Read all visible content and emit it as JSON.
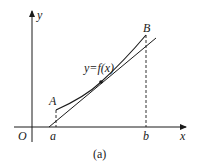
{
  "diagram": {
    "caption": "(a)",
    "function_label": "y=f(x)",
    "axes": {
      "x_label": "x",
      "y_label": "y",
      "origin_label": "O"
    },
    "points": {
      "A": "A",
      "B": "B"
    },
    "ticks": {
      "a": "a",
      "b": "b"
    },
    "colors": {
      "stroke": "#1a1a1a",
      "background": "#ffffff"
    }
  }
}
